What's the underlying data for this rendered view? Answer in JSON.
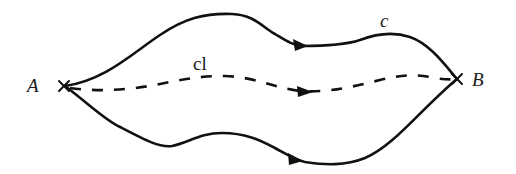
{
  "diagram": {
    "type": "path-diagram",
    "colors": {
      "stroke": "#111111",
      "background": "#ffffff"
    },
    "points": {
      "start": {
        "label": "A",
        "x": 65,
        "y": 86
      },
      "end": {
        "label": "B",
        "x": 457,
        "y": 79
      }
    },
    "paths": [
      {
        "id": "upper",
        "label": "c",
        "style": "solid",
        "arrow_direction": "A-to-B"
      },
      {
        "id": "middle",
        "label": "cl",
        "style": "dashed",
        "arrow_direction": "A-to-B"
      },
      {
        "id": "lower",
        "label": "",
        "style": "solid",
        "arrow_direction": "A-to-B"
      }
    ],
    "labels": {
      "A": "A",
      "B": "B",
      "upper_curve": "c",
      "middle_curve": "cl"
    }
  }
}
